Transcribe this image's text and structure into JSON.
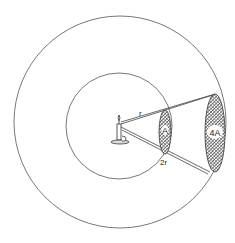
{
  "diagram": {
    "labels": {
      "inner_radius": "r",
      "outer_radius": "2r",
      "inner_area": "A",
      "outer_area": "4A"
    },
    "colors": {
      "line": "#444444",
      "hatch": "#555555",
      "background": "#ffffff"
    }
  }
}
